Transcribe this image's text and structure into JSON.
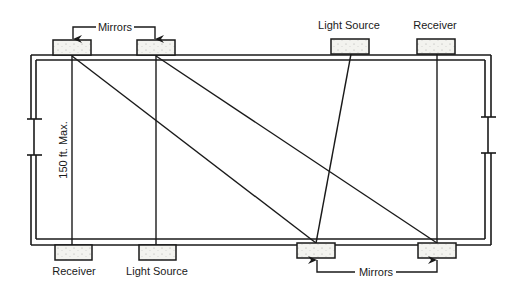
{
  "diagram": {
    "colors": {
      "line": "#1a1a1a",
      "box_fill": "#f3f3ef",
      "background": "#ffffff"
    },
    "top_labels": {
      "mirrors": "Mirrors",
      "light_source": "Light Source",
      "receiver": "Receiver"
    },
    "bottom_labels": {
      "receiver": "Receiver",
      "light_source": "Light Source",
      "mirrors": "Mirrors"
    },
    "dimension_label": "150 ft. Max.",
    "devices": {
      "top": [
        {
          "role": "mirror",
          "x": 53,
          "y": 40,
          "w": 38,
          "h": 15
        },
        {
          "role": "mirror",
          "x": 137,
          "y": 40,
          "w": 38,
          "h": 15
        },
        {
          "role": "light_source",
          "x": 331,
          "y": 39,
          "w": 38,
          "h": 15
        },
        {
          "role": "receiver",
          "x": 417,
          "y": 39,
          "w": 38,
          "h": 15
        }
      ],
      "bottom": [
        {
          "role": "receiver",
          "x": 55,
          "y": 245,
          "w": 37,
          "h": 15
        },
        {
          "role": "light_source",
          "x": 139,
          "y": 245,
          "w": 37,
          "h": 15
        },
        {
          "role": "mirror",
          "x": 297,
          "y": 243,
          "w": 38,
          "h": 15
        },
        {
          "role": "mirror",
          "x": 418,
          "y": 243,
          "w": 38,
          "h": 15
        }
      ]
    }
  }
}
